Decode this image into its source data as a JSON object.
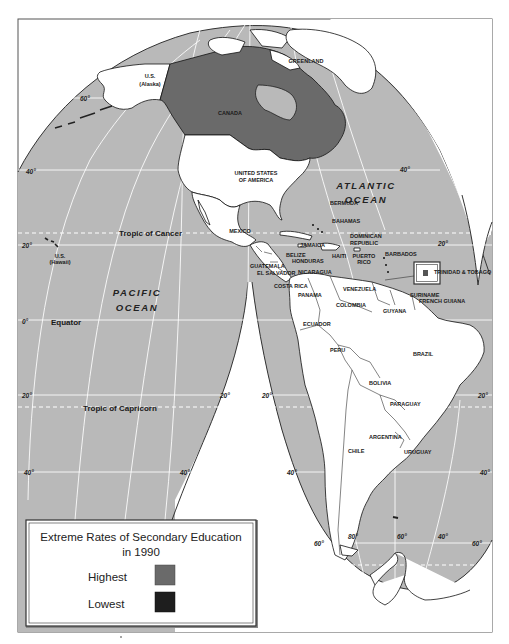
{
  "map": {
    "title": "Extreme Rates of Secondary Education in 1990",
    "colors": {
      "ocean": "#b9b9b9",
      "land_default": "#ffffff",
      "highest": "#6a6a6a",
      "lowest": "#1e1e1e",
      "outside": "#ffffff",
      "graticule": "#ffffff",
      "frame": "#555555"
    },
    "oceans": {
      "atlantic_line1": "ATLANTIC",
      "atlantic_line2": "OCEAN",
      "pacific_line1": "PACIFIC",
      "pacific_line2": "OCEAN"
    },
    "reference_lines": {
      "tropic_of_cancer": "Tropic of Cancer",
      "equator": "Equator",
      "tropic_of_capricorn": "Tropic of Capricorn"
    },
    "countries": {
      "greenland": "GREENLAND",
      "us_alaska_1": "U.S.",
      "us_alaska_2": "(Alaska)",
      "canada": "CANADA",
      "usa_1": "UNITED STATES",
      "usa_2": "OF AMERICA",
      "bermuda": "BERMUDA",
      "mexico": "MEXICO",
      "bahamas": "BAHAMAS",
      "cuba": "CUBA",
      "dominican_1": "DOMINICAN",
      "dominican_2": "REPUBLIC",
      "jamaica": "JAMAICA",
      "haiti": "HAITI",
      "puerto_rico_1": "PUERTO",
      "puerto_rico_2": "RICO",
      "barbados": "BARBADOS",
      "us_hawaii_1": "U.S.",
      "us_hawaii_2": "(Hawaii)",
      "belize": "BELIZE",
      "honduras": "HONDURAS",
      "guatemala": "GUATEMALA",
      "el_salvador": "EL SALVADOR",
      "nicaragua": "NICARAGUA",
      "costa_rica": "COSTA RICA",
      "panama": "PANAMA",
      "trinidad_tobago": "TRINIDAD & TOBAGO",
      "venezuela": "VENEZUELA",
      "suriname": "SURINAME",
      "french_guiana": "FRENCH GUIANA",
      "guyana": "GUYANA",
      "colombia": "COLOMBIA",
      "ecuador": "ECUADOR",
      "peru": "PERU",
      "brazil": "BRAZIL",
      "bolivia": "BOLIVIA",
      "paraguay": "PARAGUAY",
      "argentina": "ARGENTINA",
      "chile": "CHILE",
      "uruguay": "URUGUAY"
    },
    "degree_labels": {
      "lat60_w": "60°",
      "lat40_w": "40°",
      "lat40_e": "40°",
      "lat20_w": "20°",
      "lat20_e": "20°",
      "lat0": "0°",
      "lat20s_w": "20°",
      "lat20s_mid": "20°",
      "lat20s_mid2": "20°",
      "lat20s_e": "20°",
      "lat40s_w": "40°",
      "lat40s_mid": "40°",
      "lat40s_mid2": "40°",
      "lat40s_e": "40°",
      "lat60s_w": "60°",
      "lon80": "80°",
      "lon60": "60°",
      "lon40": "40°",
      "lat60s_e": "60°"
    },
    "legend": {
      "title_line1": "Extreme Rates of Secondary Education",
      "title_line2": "in 1990",
      "items": [
        {
          "label": "Highest",
          "color": "#6a6a6a"
        },
        {
          "label": "Lowest",
          "color": "#1e1e1e"
        }
      ]
    },
    "highlighted": {
      "highest": [
        "CANADA"
      ],
      "lowest": []
    }
  }
}
